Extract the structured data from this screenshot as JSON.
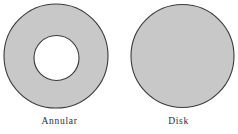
{
  "figure": {
    "background_color": "#ffffff",
    "width": 238,
    "height": 134,
    "shapes": [
      {
        "id": "annular",
        "caption": "Annular",
        "type": "annulus",
        "fill_color": "#c8c8c8",
        "stroke_color": "#3a3a3a",
        "stroke_width": 1.1,
        "center_x": 56,
        "center_y": 56,
        "outer_radius": 52,
        "inner_center_x": 56.5,
        "inner_center_y": 58,
        "inner_radius": 22.5,
        "inner_fill_color": "#ffffff"
      },
      {
        "id": "disk",
        "caption": "Disk",
        "type": "disk",
        "fill_color": "#c8c8c8",
        "stroke_color": "#3a3a3a",
        "stroke_width": 1.1,
        "center_x": 182.5,
        "center_y": 56,
        "outer_radius": 51.5
      }
    ]
  }
}
